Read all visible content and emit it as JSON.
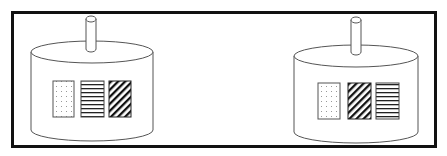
{
  "figure": {
    "frame": {
      "stroke": "#111111"
    },
    "containers": [
      {
        "id": "left",
        "panels": [
          "dotted",
          "horizontal-stripes",
          "diagonal-stripes"
        ]
      },
      {
        "id": "right",
        "panels": [
          "dotted",
          "diagonal-stripes",
          "horizontal-stripes"
        ]
      }
    ]
  }
}
